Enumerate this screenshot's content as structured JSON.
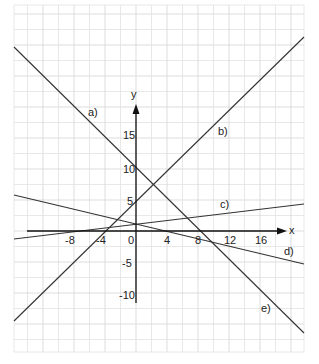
{
  "chart_data": {
    "type": "line",
    "title": "",
    "xlabel": "x",
    "ylabel": "y",
    "x_ticks": [
      -8,
      -4,
      0,
      4,
      8,
      12,
      16
    ],
    "y_ticks": [
      15,
      10,
      5,
      -5,
      -10
    ],
    "xlim": [
      -15.5,
      22
    ],
    "ylim": [
      -19.5,
      36
    ],
    "grid": true,
    "legend": "none",
    "series": [
      {
        "name": "a)",
        "shared_line_with": "e)",
        "y_intercept": 10,
        "x_intercept": 8.5,
        "slope": -1.18
      },
      {
        "name": "b)",
        "y_intercept": 5,
        "x_intercept": -4,
        "slope": 1.25
      },
      {
        "name": "c)",
        "y_intercept": 1.6,
        "x_intercept": -8.5,
        "slope": 0.19
      },
      {
        "name": "d)",
        "y_intercept": 1.7,
        "x_intercept": 5,
        "slope": -0.33
      },
      {
        "name": "e)",
        "shared_line_with": "a)",
        "y_intercept": 10,
        "x_intercept": 8.5,
        "slope": -1.18
      }
    ],
    "annotations": [
      "a)",
      "b)",
      "c)",
      "d)",
      "e)"
    ]
  },
  "labels": {
    "x_axis": "x",
    "y_axis": "y",
    "origin": "0",
    "x_ticks": [
      "-8",
      "-4",
      "4",
      "8",
      "12",
      "16"
    ],
    "y_ticks": [
      "15",
      "10",
      "5",
      "-5",
      "-10"
    ],
    "line_a": "a)",
    "line_b": "b)",
    "line_c": "c)",
    "line_d": "d)",
    "line_e": "e)"
  },
  "colors": {
    "grid": "#e2e2e2",
    "grid_major": "#d4d4d4",
    "lines": "#333333",
    "axis": "#111111"
  }
}
